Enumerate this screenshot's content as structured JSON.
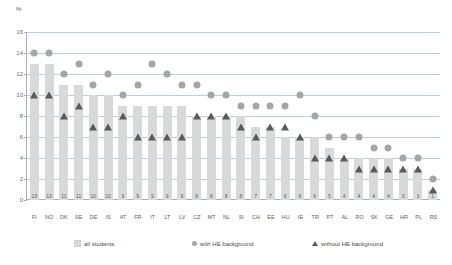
{
  "chart_data": {
    "type": "bar",
    "title": "",
    "subtitle": "",
    "xlabel": "",
    "ylabel": "%",
    "ylim": [
      0,
      16
    ],
    "ytick_values": [
      0,
      2,
      4,
      6,
      8,
      10,
      12,
      14,
      16
    ],
    "ytick_labels": [
      "0",
      "2",
      "4",
      "6",
      "8",
      "10",
      "12",
      "14",
      "16"
    ],
    "grid": true,
    "legend_position": "bottom",
    "categories": [
      "FI",
      "NO",
      "DK",
      "SE",
      "DE",
      "IS",
      "AT",
      "FR",
      "IT",
      "LT",
      "LV",
      "CZ",
      "MT",
      "NL",
      "SI",
      "CH",
      "EE",
      "HU",
      "IE",
      "TR",
      "PT",
      "AL",
      "RO",
      "SK",
      "GE",
      "HR",
      "PL",
      "RS"
    ],
    "bar_labels": [
      "13",
      "13",
      "11",
      "11",
      "10",
      "10",
      "9",
      "9",
      "9",
      "9",
      "9",
      "8",
      "8",
      "8",
      "8",
      "7",
      "7",
      "6",
      "6",
      "6",
      "5",
      "4",
      "4",
      "4",
      "4",
      "3",
      "3",
      "1"
    ],
    "series": [
      {
        "name": "all students",
        "marker": "bar",
        "color": "#d9d9d9",
        "values": [
          13,
          13,
          11,
          11,
          10,
          10,
          9,
          9,
          9,
          9,
          9,
          8,
          8,
          8,
          8,
          7,
          7,
          6,
          6,
          6,
          5,
          4,
          4,
          4,
          4,
          3,
          3,
          1
        ]
      },
      {
        "name": "with HE background",
        "marker": "circle",
        "color": "#a6a6a6",
        "values": [
          14,
          14,
          12,
          13,
          11,
          12,
          10,
          11,
          13,
          12,
          11,
          11,
          10,
          10,
          9,
          9,
          9,
          9,
          10,
          8,
          6,
          6,
          6,
          5,
          5,
          4,
          4,
          2
        ]
      },
      {
        "name": "without HE background",
        "marker": "triangle",
        "color": "#595959",
        "values": [
          10,
          10,
          8,
          9,
          7,
          7,
          8,
          6,
          6,
          6,
          6,
          8,
          8,
          8,
          7,
          6,
          7,
          7,
          6,
          4,
          4,
          4,
          3,
          3,
          3,
          3,
          3,
          1
        ]
      }
    ]
  },
  "legend": {
    "items": [
      {
        "label": "all students",
        "swatch": "bar-swatch-icon"
      },
      {
        "label": "with HE background",
        "swatch": "circle-marker-icon"
      },
      {
        "label": "without HE background",
        "swatch": "triangle-marker-icon"
      }
    ]
  }
}
